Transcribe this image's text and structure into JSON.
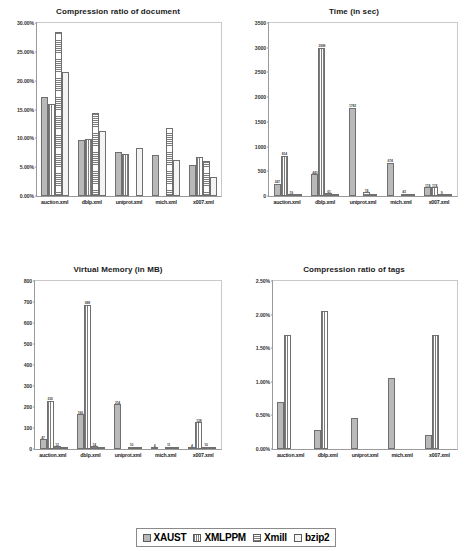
{
  "series_names": [
    "XAUST",
    "XMLPPM",
    "Xmill",
    "bzip2"
  ],
  "legend": {
    "items": [
      {
        "label": "XAUST",
        "swatch": "solid-gray-swatch"
      },
      {
        "label": "XMLPPM",
        "swatch": "vertical-stripe-swatch"
      },
      {
        "label": "Xmill",
        "swatch": "horizontal-stripe-swatch"
      },
      {
        "label": "bzip2",
        "swatch": "light-solid-swatch"
      }
    ]
  },
  "categories": [
    "auction.xml",
    "dblp.xml",
    "uniprot.xml",
    "mich.xml",
    "x007.xml"
  ],
  "chart_data": [
    {
      "type": "bar",
      "title": "Compression ratio of document",
      "xlabel": "",
      "ylabel": "",
      "ylim": [
        0,
        30
      ],
      "yticks": [
        "0.00%",
        "5.00%",
        "10.00%",
        "15.00%",
        "20.00%",
        "25.00%",
        "30.00%"
      ],
      "ytick_values": [
        0,
        5,
        10,
        15,
        20,
        25,
        30
      ],
      "grid": false,
      "legend_position": "bottom-shared",
      "categories": [
        "auction.xml",
        "dblp.xml",
        "uniprot.xml",
        "mich.xml",
        "x007.xml"
      ],
      "series": [
        {
          "name": "XAUST",
          "values": [
            17.2,
            9.8,
            7.6,
            7.1,
            5.3
          ]
        },
        {
          "name": "XMLPPM",
          "values": [
            16.0,
            9.9,
            7.3,
            null,
            6.8
          ]
        },
        {
          "name": "Xmill",
          "values": [
            28.4,
            14.4,
            null,
            11.8,
            6.1
          ]
        },
        {
          "name": "bzip2",
          "values": [
            21.5,
            11.3,
            8.4,
            6.3,
            3.3
          ]
        }
      ]
    },
    {
      "type": "bar",
      "title": "Time (in sec)",
      "xlabel": "",
      "ylabel": "",
      "ylim": [
        0,
        3500
      ],
      "yticks": [
        "0",
        "500",
        "1000",
        "1500",
        "2000",
        "2500",
        "3000",
        "3500"
      ],
      "ytick_values": [
        0,
        500,
        1000,
        1500,
        2000,
        2500,
        3000,
        3500
      ],
      "grid": false,
      "legend_position": "bottom-shared",
      "categories": [
        "auction.xml",
        "dblp.xml",
        "uniprot.xml",
        "mich.xml",
        "x007.xml"
      ],
      "series": [
        {
          "name": "XAUST",
          "values": [
            247,
            443,
            1782,
            674,
            174
          ],
          "labels": [
            "247",
            "443",
            "1782",
            "674",
            "174"
          ]
        },
        {
          "name": "XMLPPM",
          "values": [
            814,
            2999,
            null,
            null,
            174
          ],
          "labels": [
            "814",
            "2999",
            "",
            "",
            "174"
          ]
        },
        {
          "name": "Xmill",
          "values": [
            19,
            61,
            74,
            43,
            9
          ],
          "labels": [
            "19",
            "61",
            "74",
            "43",
            "9"
          ]
        },
        {
          "name": "bzip2",
          "values": [
            10,
            12,
            10,
            8,
            5
          ],
          "labels": [
            "",
            "",
            "",
            "",
            ""
          ]
        }
      ]
    },
    {
      "type": "bar",
      "title": "Virtual Memory (in MB)",
      "xlabel": "",
      "ylabel": "",
      "ylim": [
        0,
        800
      ],
      "yticks": [
        "0",
        "100",
        "200",
        "300",
        "400",
        "500",
        "600",
        "700",
        "800"
      ],
      "ytick_values": [
        0,
        100,
        200,
        300,
        400,
        500,
        600,
        700,
        800
      ],
      "grid": false,
      "legend_position": "bottom-shared",
      "categories": [
        "auction.xml",
        "dblp.xml",
        "uniprot.xml",
        "mich.xml",
        "x007.xml"
      ],
      "series": [
        {
          "name": "XAUST",
          "values": [
            47,
            166,
            214,
            4,
            4
          ],
          "labels": [
            "47",
            "166",
            "214",
            "4",
            "4"
          ]
        },
        {
          "name": "XMLPPM",
          "values": [
            230,
            688,
            null,
            null,
            128
          ],
          "labels": [
            "230",
            "688",
            "",
            "",
            "128"
          ]
        },
        {
          "name": "Xmill",
          "values": [
            12,
            14,
            10,
            11,
            10
          ],
          "labels": [
            "12",
            "14",
            "10",
            "11",
            "10"
          ]
        },
        {
          "name": "bzip2",
          "values": [
            6,
            6,
            5,
            4,
            5
          ],
          "labels": [
            "",
            "",
            "",
            "",
            ""
          ]
        }
      ]
    },
    {
      "type": "bar",
      "title": "Compression ratio of tags",
      "xlabel": "",
      "ylabel": "",
      "ylim": [
        0,
        2.5
      ],
      "yticks": [
        "0.00%",
        "0.50%",
        "1.00%",
        "1.50%",
        "2.00%",
        "2.50%"
      ],
      "ytick_values": [
        0,
        0.5,
        1.0,
        1.5,
        2.0,
        2.5
      ],
      "grid": false,
      "legend_position": "bottom-shared",
      "categories": [
        "auction.xml",
        "dblp.xml",
        "uniprot.xml",
        "mich.xml",
        "x007.xml"
      ],
      "series": [
        {
          "name": "XAUST",
          "values": [
            0.7,
            0.29,
            0.46,
            1.06,
            0.21
          ]
        },
        {
          "name": "XMLPPM",
          "values": [
            1.69,
            2.06,
            null,
            null,
            1.69
          ]
        },
        {
          "name": "Xmill",
          "values": [
            null,
            null,
            null,
            null,
            null
          ]
        },
        {
          "name": "bzip2",
          "values": [
            null,
            null,
            null,
            null,
            null
          ]
        }
      ]
    }
  ]
}
